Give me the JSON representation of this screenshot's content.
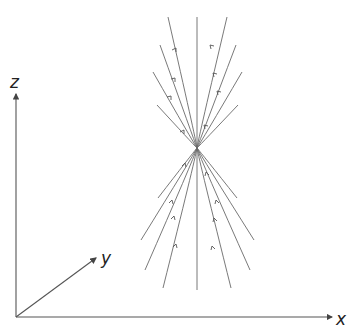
{
  "diagram": {
    "title": "",
    "axes": {
      "x_label": "x",
      "y_label": "y",
      "z_label": "z"
    },
    "focal_point": {
      "x": 197,
      "y": 148
    },
    "ray_count": 9
  }
}
